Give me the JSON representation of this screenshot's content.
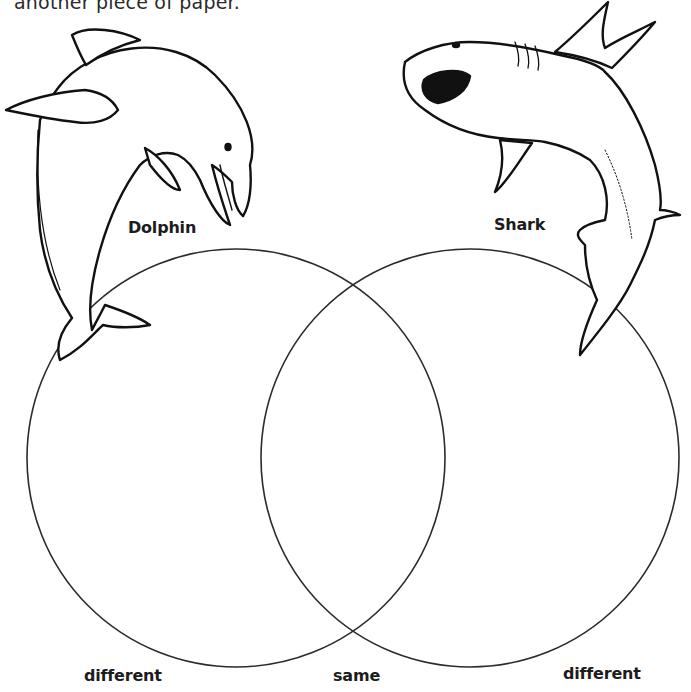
{
  "worksheet": {
    "instruction_fragment": "another piece of paper.",
    "animals": [
      {
        "name": "Dolphin",
        "icon": "dolphin-illustration"
      },
      {
        "name": "Shark",
        "icon": "shark-illustration"
      }
    ],
    "venn": {
      "left_label": "different",
      "middle_label": "same",
      "right_label": "different",
      "left_circle": {
        "cx": 236,
        "cy": 458,
        "r": 209
      },
      "right_circle": {
        "cx": 470,
        "cy": 458,
        "r": 209
      },
      "stroke_color": "#2b2b2b"
    }
  }
}
